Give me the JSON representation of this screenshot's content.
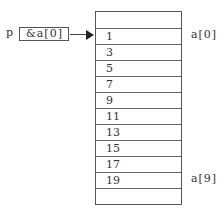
{
  "pointer": {
    "name": "p",
    "value": "&a[0]"
  },
  "array": {
    "cells": [
      "",
      "1",
      "3",
      "5",
      "7",
      "9",
      "11",
      "13",
      "15",
      "17",
      "19",
      ""
    ]
  },
  "labels": {
    "first": "a[0]",
    "last": "a[9]"
  }
}
